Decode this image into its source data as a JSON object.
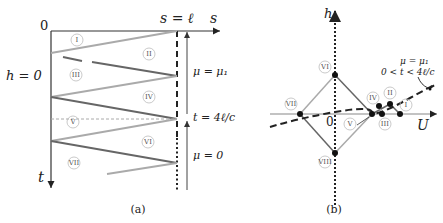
{
  "panel_a": {
    "caption": "(a)",
    "axis_s_label": "s",
    "axis_t_label": "t",
    "origin_label": "0",
    "boundary_label": "s = ℓ",
    "h_label": "h = 0",
    "mu1_label": "μ = μ₁",
    "t_label": "t = 4ℓ/c",
    "mu0_label": "μ = 0",
    "regions": [
      "I",
      "II",
      "III",
      "IV",
      "V",
      "VI",
      "VII"
    ]
  },
  "panel_b": {
    "caption": "(b)",
    "axis_h_label": "h",
    "axis_U_label": "U",
    "origin_label": "0",
    "annotation_line1": "μ = μ₁",
    "annotation_line2": "0 < t < 4ℓ/c",
    "regions": [
      "I",
      "II",
      "III",
      "IV",
      "V",
      "VI",
      "VII",
      "VIII"
    ]
  }
}
